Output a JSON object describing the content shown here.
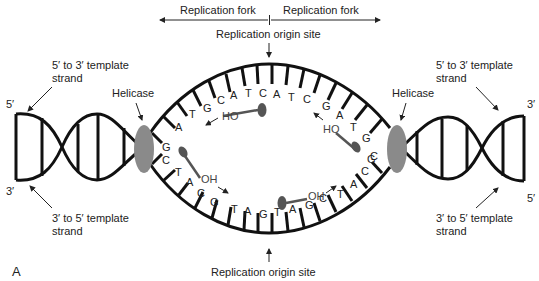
{
  "panel_label": "A",
  "top": {
    "fork_left": "Replication fork",
    "fork_right": "Replication fork",
    "origin": "Replication origin site"
  },
  "bottom": {
    "origin": "Replication origin site"
  },
  "left": {
    "top_strand_label_line1": "5′ to 3′ template",
    "top_strand_label_line2": "strand",
    "bottom_strand_label_line1": "3′ to 5′ template",
    "bottom_strand_label_line2": "strand",
    "top_end": "5′",
    "bottom_end": "3′",
    "enzyme": "Helicase"
  },
  "right": {
    "top_strand_label_line1": "5′ to 3′ template",
    "top_strand_label_line2": "strand",
    "bottom_strand_label_line1": "3′ to 5′ template",
    "bottom_strand_label_line2": "strand",
    "top_end": "3′",
    "bottom_end": "5′",
    "enzyme": "Helicase"
  },
  "bubble": {
    "top_strand_bases": [
      "G",
      "A",
      "T",
      "G",
      "C",
      "A",
      "T",
      "C",
      "A",
      "T",
      "C",
      "G",
      "A",
      "T",
      "G",
      "C"
    ],
    "bottom_strand_bases": [
      "C",
      "T",
      "A",
      "C",
      "G",
      "T",
      "A",
      "G",
      "T",
      "A",
      "G",
      "C",
      "T",
      "A",
      "C",
      "G"
    ],
    "primer_labels": {
      "upper_left": "HO",
      "upper_right": "HO",
      "lower_left": "OH",
      "lower_right": "OH"
    }
  },
  "colors": {
    "strand": "#111111",
    "helicase": "#8a8a8a",
    "primer": "#555555",
    "text": "#222222"
  }
}
